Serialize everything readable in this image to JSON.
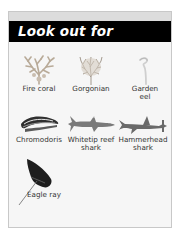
{
  "header": {
    "title": "Look out for"
  },
  "items": [
    {
      "name": "fire-coral",
      "label": "Fire coral",
      "icon": "fire-coral-icon"
    },
    {
      "name": "gorgonian",
      "label": "Gorgonian",
      "icon": "gorgonian-icon"
    },
    {
      "name": "garden-eel",
      "label": "Garden eel",
      "label_lines": [
        "Garden",
        "eel"
      ],
      "icon": "garden-eel-icon"
    },
    {
      "name": "chromodoris",
      "label": "Chromodoris",
      "icon": "chromodoris-icon"
    },
    {
      "name": "whitetip-reef-shark",
      "label": "Whitetip reef shark",
      "label_lines": [
        "Whitetip reef",
        "shark"
      ],
      "icon": "whitetip-reef-shark-icon"
    },
    {
      "name": "hammerhead-shark",
      "label": "Hammerhead shark",
      "label_lines": [
        "Hammerhead",
        "shark"
      ],
      "icon": "hammerhead-shark-icon"
    },
    {
      "name": "eagle-ray",
      "label": "Eagle ray",
      "icon": "eagle-ray-icon"
    }
  ],
  "colors": {
    "banner": "#000000",
    "title": "#ffffff",
    "panel": "#f6f6f6",
    "strip": "#dcdcdc",
    "border": "#c8c8c8"
  }
}
